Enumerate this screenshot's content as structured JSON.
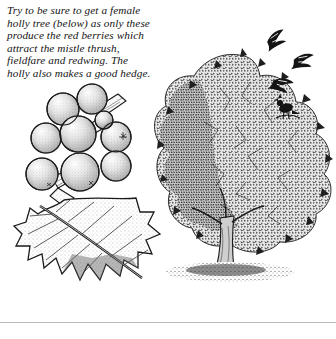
{
  "page": {
    "background_color": "#ffffff",
    "ink_color": "#1a1a1a",
    "rule_color": "#b9b9b9"
  },
  "caption": {
    "name": "holly-caption",
    "style": "italic serif",
    "full_text": "Try to be sure to get a female holly tree (below) as only these produce the red berries which attract the mistle thrush, fieldfare and redwing. The holly also makes a good hedge.",
    "lines": [
      "Try to be sure to get a female",
      "holly tree (below) as only these",
      "produce the red berries which",
      "attract the mistle thrush,",
      "fieldfare and redwing. The",
      "holly also makes a good hedge."
    ]
  },
  "illustrations": {
    "holly": {
      "label": "holly-berries-and-leaf",
      "description": "Pen-and-ink drawing of a holly branch bearing a cluster of round stippled berries with a large spiny holly leaf below",
      "berry_count": 9,
      "leaf_spine_count": 9
    },
    "tree": {
      "label": "holly-tree",
      "description": "Pen-and-ink drawing of a full holly tree with dense stippled foliage, a short trunk and a shadow at its base",
      "birds_in_flight": 3,
      "birds_perched": 1
    }
  }
}
